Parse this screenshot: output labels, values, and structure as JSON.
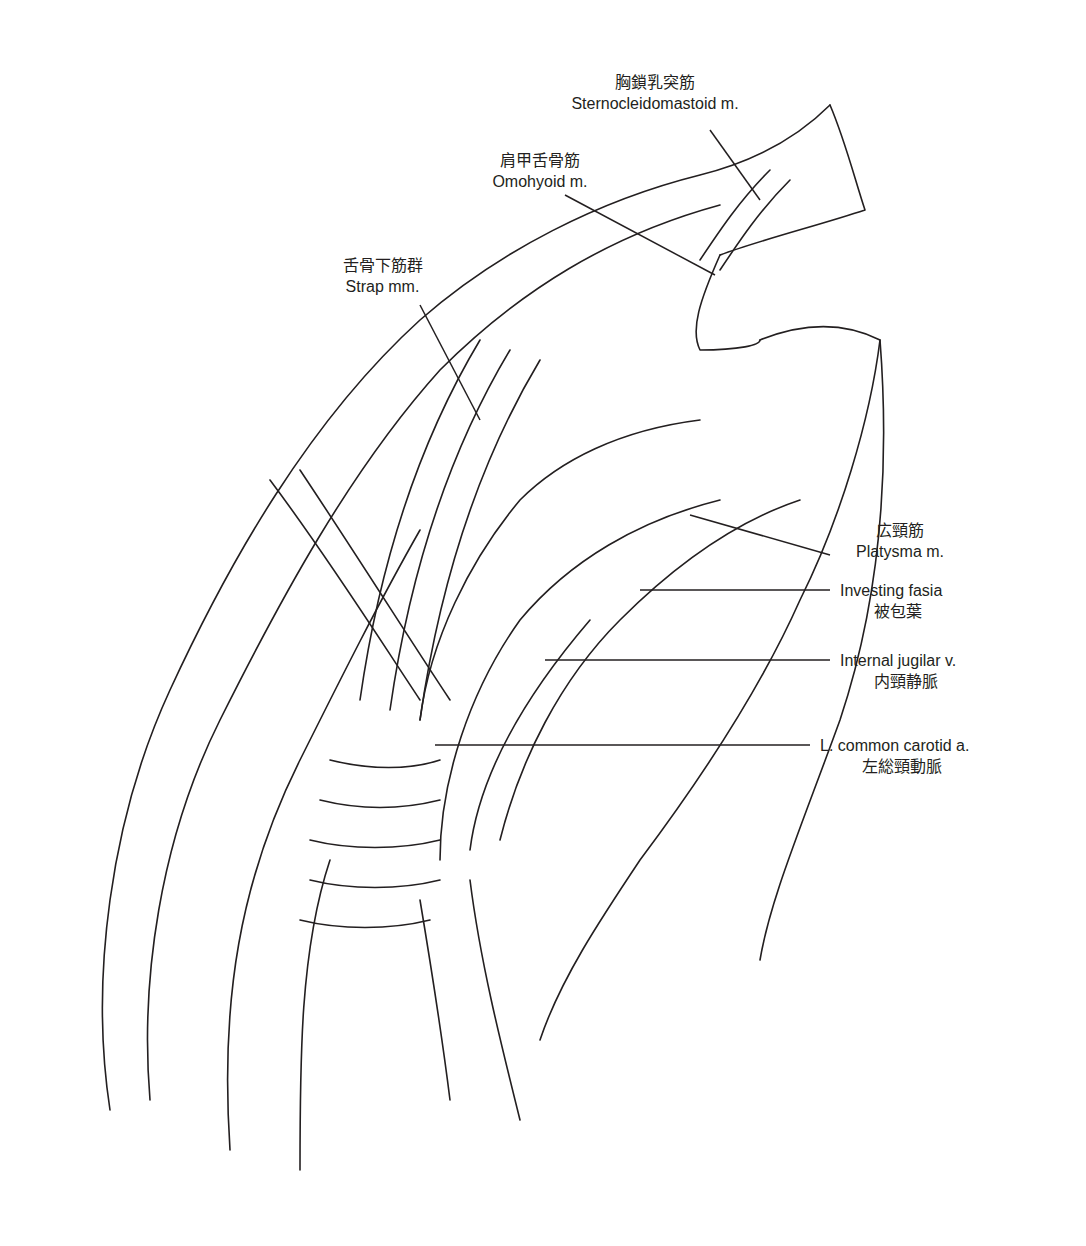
{
  "figure": {
    "background": "#ffffff",
    "ink": "#231f20"
  },
  "labels": [
    {
      "id": "sternocleidomastoid",
      "jp": "胸鎖乳突筋",
      "en": "Sternocleidomastoid m."
    },
    {
      "id": "omohyoid",
      "jp": "肩甲舌骨筋",
      "en": "Omohyoid m."
    },
    {
      "id": "strap",
      "jp": "舌骨下筋群",
      "en": "Strap mm."
    },
    {
      "id": "platysma",
      "jp": "広頸筋",
      "en": "Platysma m."
    },
    {
      "id": "investing",
      "en": "Investing fasia",
      "jp": "被包葉"
    },
    {
      "id": "ijv",
      "en": "Internal jugilar v.",
      "jp": "内頸静脈"
    },
    {
      "id": "carotid",
      "en": "L. common carotid a.",
      "jp": "左総頸動脈"
    }
  ]
}
